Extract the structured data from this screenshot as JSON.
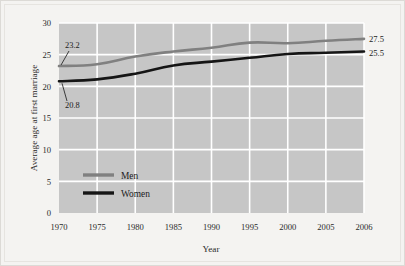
{
  "chart_data": {
    "type": "line",
    "title": "",
    "xlabel": "Year",
    "ylabel": "Average age at first marriage",
    "categories": [
      "1970",
      "1975",
      "1980",
      "1985",
      "1990",
      "1995",
      "2000",
      "2005",
      "2006"
    ],
    "x_tick_labels": [
      "1970",
      "1975",
      "1980",
      "1985",
      "1990",
      "1995",
      "2000",
      "2005",
      "2006"
    ],
    "y_tick_labels": [
      "0",
      "5",
      "10",
      "15",
      "20",
      "25",
      "30"
    ],
    "y_ticks": [
      0,
      5,
      10,
      15,
      20,
      25,
      30
    ],
    "ylim": [
      0,
      30
    ],
    "grid": true,
    "legend_position": "inside-lower-left",
    "series": [
      {
        "name": "Men",
        "color": "#808080",
        "values": [
          23.2,
          23.5,
          24.7,
          25.5,
          26.1,
          26.9,
          26.8,
          27.2,
          27.5
        ]
      },
      {
        "name": "Women",
        "color": "#151515",
        "values": [
          20.8,
          21.1,
          22.0,
          23.3,
          23.9,
          24.5,
          25.1,
          25.3,
          25.5
        ]
      }
    ],
    "annotations": [
      {
        "text": "23.2",
        "series": "Men",
        "at_category": "1970",
        "value": 23.2,
        "position": "upper-left-leader"
      },
      {
        "text": "20.8",
        "series": "Women",
        "at_category": "1970",
        "value": 20.8,
        "position": "lower-left-leader"
      },
      {
        "text": "27.5",
        "series": "Men",
        "at_category": "2006",
        "value": 27.5,
        "position": "right-end"
      },
      {
        "text": "25.5",
        "series": "Women",
        "at_category": "2006",
        "value": 25.5,
        "position": "right-end"
      }
    ],
    "colors": {
      "plot_background": "#c6c6c6",
      "gridline": "#ffffff",
      "figure_background": "#f4f3f1",
      "men_line": "#808080",
      "women_line": "#151515",
      "text": "#1c1c1c"
    }
  },
  "legend": {
    "items": [
      {
        "label": "Men"
      },
      {
        "label": "Women"
      }
    ]
  }
}
